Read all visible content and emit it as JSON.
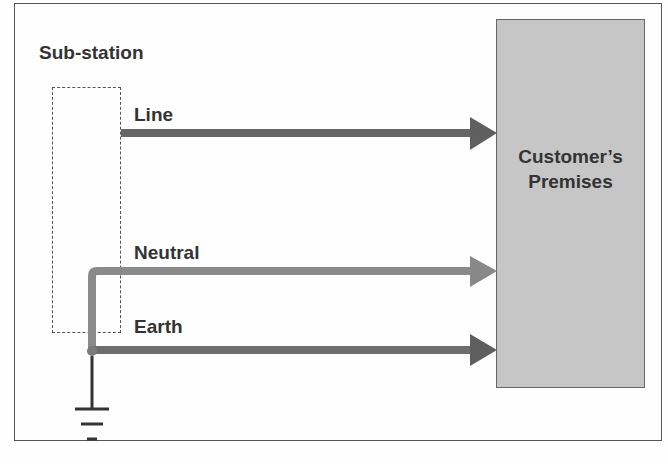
{
  "diagram": {
    "substation_label": "Sub-station",
    "customer_label_line1": "Customer’s",
    "customer_label_line2": "Premises",
    "conductors": [
      {
        "name": "Line",
        "color": "#666666"
      },
      {
        "name": "Neutral",
        "color": "#8a8a8a"
      },
      {
        "name": "Earth",
        "color": "#6e6e6e"
      }
    ],
    "ground_symbol": "earth-ground",
    "colors": {
      "customer_fill": "#c6c6c6",
      "line": "#666666",
      "neutral": "#8a8a8a",
      "earth": "#6e6e6e",
      "ground": "#333333"
    }
  }
}
